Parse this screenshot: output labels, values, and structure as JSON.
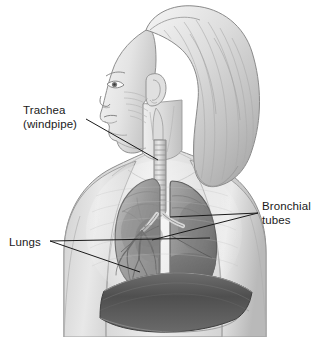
{
  "figure": {
    "background_color": "#ffffff",
    "ink_color": "#1a1a1a",
    "width": 319,
    "height": 337
  },
  "labels": [
    {
      "id": "trachea",
      "line1": "Trachea",
      "line2": "(windpipe)",
      "target": "trachea"
    },
    {
      "id": "bronchial",
      "line1": "Bronchial",
      "line2": "tubes",
      "target": "bronchi"
    },
    {
      "id": "lungs",
      "line1": "Lungs",
      "line2": "",
      "target": "lungs"
    }
  ],
  "anatomy": {
    "parts": [
      "head",
      "hair",
      "face-profile",
      "ear",
      "neck",
      "shoulders",
      "torso",
      "trachea",
      "left-lung",
      "right-lung",
      "bronchi",
      "bronchial-tree",
      "diaphragm"
    ]
  },
  "palette": {
    "paper": "#ffffff",
    "skin_light": "#f0f0f0",
    "skin_mid": "#d2d2d2",
    "skin_shadow": "#a8a8a8",
    "hair_light": "#ededed",
    "hair_mid": "#cccccc",
    "hair_dark": "#9a9a9a",
    "lung_light": "#b4b4b4",
    "lung_mid": "#949494",
    "lung_dark": "#6e6e6e",
    "diaphragm": "#595959",
    "outline": "#6b6b6b",
    "outline_soft": "#9c9c9c",
    "leader": "#1a1a1a"
  }
}
